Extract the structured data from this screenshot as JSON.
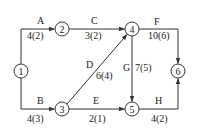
{
  "diagram": {
    "type": "activity-on-arrow network",
    "nodes": [
      {
        "id": "1",
        "label": "1",
        "x": 21,
        "y": 71
      },
      {
        "id": "2",
        "label": "2",
        "x": 62,
        "y": 29
      },
      {
        "id": "3",
        "label": "3",
        "x": 62,
        "y": 109
      },
      {
        "id": "4",
        "label": "4",
        "x": 132,
        "y": 29
      },
      {
        "id": "5",
        "label": "5",
        "x": 132,
        "y": 109
      },
      {
        "id": "6",
        "label": "6",
        "x": 178,
        "y": 71
      }
    ],
    "activities": [
      {
        "name": "A",
        "duration": "4(2)",
        "from": "1",
        "to": "2"
      },
      {
        "name": "B",
        "duration": "4(3)",
        "from": "1",
        "to": "3"
      },
      {
        "name": "C",
        "duration": "3(2)",
        "from": "2",
        "to": "4"
      },
      {
        "name": "D",
        "duration": "6(4)",
        "from": "3",
        "to": "4"
      },
      {
        "name": "E",
        "duration": "2(1)",
        "from": "3",
        "to": "5"
      },
      {
        "name": "F",
        "duration": "10(6)",
        "from": "4",
        "to": "6"
      },
      {
        "name": "G",
        "duration": "7(5)",
        "from": "4",
        "to": "5"
      },
      {
        "name": "H",
        "duration": "4(2)",
        "from": "5",
        "to": "6"
      }
    ]
  }
}
